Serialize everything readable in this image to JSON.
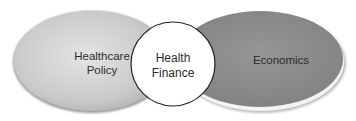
{
  "diagram": {
    "type": "venn",
    "nodes": [
      {
        "id": "left",
        "line1": "Healthcare",
        "line2": "Policy",
        "fill": "#cfcfcf",
        "shape": "ellipse"
      },
      {
        "id": "center",
        "line1": "Health",
        "line2": "Finance",
        "fill": "#ffffff",
        "shape": "circle"
      },
      {
        "id": "right",
        "label": "Economics",
        "fill": "#8f8f8f",
        "shape": "ellipse"
      }
    ],
    "relations": [
      {
        "from": "left",
        "to": "center",
        "type": "overlap"
      },
      {
        "from": "right",
        "to": "center",
        "type": "overlap"
      }
    ]
  }
}
